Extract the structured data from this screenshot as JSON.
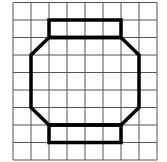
{
  "figure": {
    "grid": {
      "columns": 8,
      "rows": 9,
      "origin_x": 13,
      "origin_y": 2.5,
      "cell_w": 18,
      "cell_h": 17.5,
      "line_color": "#555555",
      "line_width": 1
    },
    "shape": {
      "stroke_color": "#000000",
      "stroke_width": 3.5,
      "top_rectangle_cells": {
        "x0": 2,
        "y0": 1,
        "x1": 6,
        "y1": 2
      },
      "octagon_cells": [
        [
          2,
          2
        ],
        [
          6,
          2
        ],
        [
          7,
          3
        ],
        [
          7,
          6
        ],
        [
          6,
          7
        ],
        [
          2,
          7
        ],
        [
          1,
          6
        ],
        [
          1,
          3
        ]
      ],
      "bottom_rectangle_cells": {
        "x0": 2,
        "y0": 7,
        "x1": 6,
        "y1": 8
      }
    }
  }
}
